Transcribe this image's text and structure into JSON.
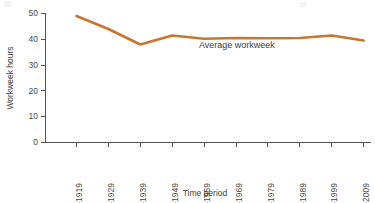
{
  "chart_data": {
    "type": "line",
    "title": "",
    "xlabel": "Time period",
    "ylabel": "Workweek hours",
    "categories": [
      "1910–1919",
      "1920–1929",
      "1930–1939",
      "1940–1949",
      "1950–1959",
      "1960–1969",
      "1970–1979",
      "1980–1989",
      "1990–1999",
      "2000–2009"
    ],
    "series": [
      {
        "name": "Average workweek",
        "color": "#c8762e",
        "values": [
          49.0,
          44.0,
          38.0,
          41.5,
          40.2,
          40.5,
          40.4,
          40.5,
          41.5,
          39.5
        ]
      }
    ],
    "ylim": [
      0,
      50
    ],
    "yticks": [
      0,
      10,
      20,
      30,
      40,
      50
    ],
    "ytick_labels": [
      "0",
      "10",
      "20",
      "30",
      "40",
      "50"
    ],
    "grid": false,
    "legend_position": "inline-annotation",
    "annotations": [
      {
        "text": "Average workweek",
        "x_category": "1950–1959",
        "y": 36
      }
    ]
  },
  "colors": {
    "series": "#c8762e",
    "axis": "#555555",
    "text": "#3d3d3d",
    "background": "#ffffff"
  }
}
